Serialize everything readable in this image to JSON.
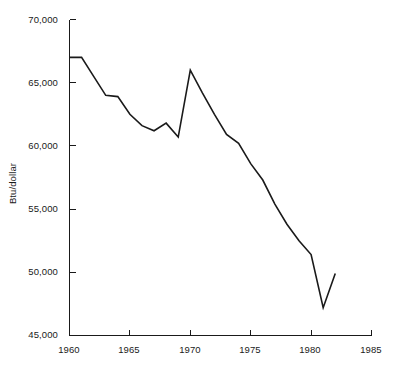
{
  "chart_data": {
    "type": "line",
    "title": "",
    "subtitle": "",
    "xlabel": "",
    "ylabel": "Btu/dollar",
    "xlim": [
      1960,
      1985
    ],
    "ylim": [
      45000,
      70000
    ],
    "grid": false,
    "legend": null,
    "x": [
      1960,
      1961,
      1962,
      1963,
      1964,
      1965,
      1966,
      1967,
      1968,
      1969,
      1970,
      1971,
      1972,
      1973,
      1974,
      1975,
      1976,
      1977,
      1978,
      1979,
      1980,
      1981,
      1982
    ],
    "values": [
      67000,
      67000,
      65500,
      64000,
      63900,
      62500,
      61600,
      61200,
      61800,
      60700,
      66000,
      64200,
      62500,
      60900,
      60200,
      58600,
      57300,
      55400,
      53800,
      52500,
      51400,
      47200,
      49900
    ],
    "series": [
      {
        "name": "Energy intensity",
        "color": "#1a1a1a",
        "values": [
          67000,
          67000,
          65500,
          64000,
          63900,
          62500,
          61600,
          61200,
          61800,
          60700,
          66000,
          64200,
          62500,
          60900,
          60200,
          58600,
          57300,
          55400,
          53800,
          52500,
          51400,
          47200,
          49900
        ]
      }
    ],
    "x_ticks": [
      1960,
      1965,
      1970,
      1975,
      1980,
      1985
    ],
    "x_tick_labels": [
      "1960",
      "1965",
      "1970",
      "1975",
      "1980",
      "1985"
    ],
    "y_ticks": [
      45000,
      50000,
      55000,
      60000,
      65000,
      70000
    ],
    "y_tick_labels": [
      "45,000",
      "50,000",
      "55,000",
      "60,000",
      "65,000",
      "70,000"
    ],
    "axis_color": "#1a1a1a",
    "line_color": "#1a1a1a",
    "background_color": "#ffffff"
  }
}
